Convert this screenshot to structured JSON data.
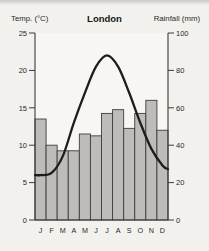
{
  "header": {
    "left_axis_title": "Temp. (°C)",
    "title": "London",
    "right_axis_title": "Rainfall (mm)"
  },
  "annotation": "Average rainfall: 612 mm a year",
  "chart_data": {
    "type": "bar",
    "subtype": "climate-graph (bar + smooth line, dual axis)",
    "title": "London",
    "annotation": "Average rainfall: 612 mm a year",
    "categories": [
      "J",
      "F",
      "M",
      "A",
      "M",
      "J",
      "J",
      "A",
      "S",
      "O",
      "N",
      "D"
    ],
    "series": [
      {
        "name": "Rainfall (mm)",
        "type": "bar",
        "axis": "right",
        "values": [
          54,
          40,
          37,
          37,
          46,
          45,
          57,
          59,
          49,
          57,
          64,
          48
        ]
      },
      {
        "name": "Temperature (°C)",
        "type": "line",
        "axis": "left",
        "values": [
          6,
          6.3,
          8.5,
          13,
          17,
          20.5,
          22,
          20.5,
          17,
          13,
          9.5,
          7.3
        ],
        "edge_start": 6,
        "edge_end": 6.8
      }
    ],
    "left_axis": {
      "label": "Temp. (°C)",
      "ticks": [
        0,
        5,
        10,
        15,
        20,
        25
      ],
      "range": [
        0,
        25
      ]
    },
    "right_axis": {
      "label": "Rainfall (mm)",
      "ticks": [
        0,
        20,
        40,
        60,
        80,
        100
      ],
      "range": [
        0,
        100
      ]
    },
    "grid": false,
    "colors": {
      "bar_fill": "#bdbcb8",
      "bar_stroke": "#3e3e3c",
      "line": "#1d1d1b",
      "axis": "#3a3a38",
      "text": "#2a2a2a",
      "background": "#f2f1ed",
      "plot_background": "#f7f6f2"
    }
  }
}
